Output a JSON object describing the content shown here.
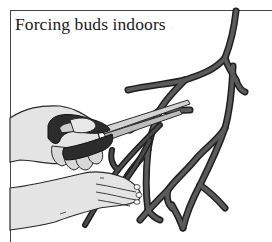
{
  "figure": {
    "title": "Forcing buds indoors",
    "illustration": {
      "subject": "hands cutting branches with scissors",
      "elements": [
        "branch",
        "scissors",
        "hand-holding-scissors",
        "hand-holding-branch"
      ]
    },
    "colors": {
      "branch": "#4a4a4a",
      "branch_outline": "#1e1e1e",
      "skin": "#e6e6e6",
      "scissor_handle": "#2e2e2e",
      "blade": "#cfcfcf",
      "frame": "#444444"
    }
  }
}
